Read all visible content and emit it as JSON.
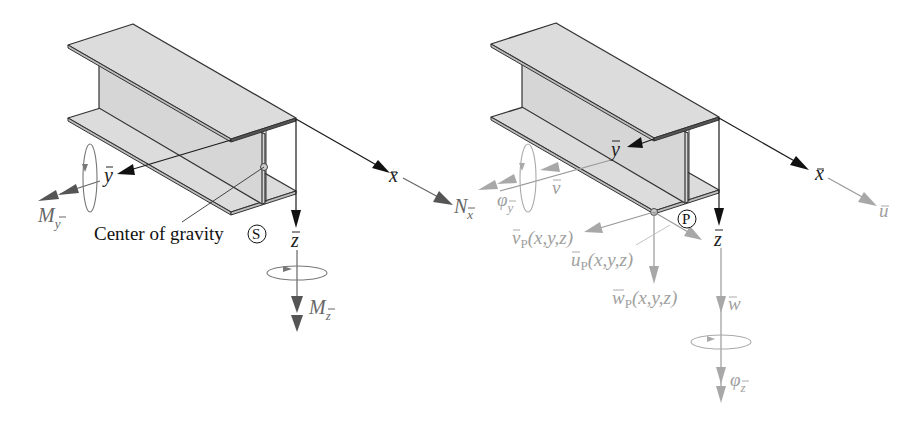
{
  "figure": {
    "left_panel": {
      "name": "Internal forces and moments at center of gravity",
      "axes": {
        "x": "x",
        "y": "y",
        "z": "z"
      },
      "force_labels": {
        "normal_force": {
          "main": "N",
          "sub": "x"
        },
        "moment_y": {
          "main": "M",
          "sub": "y"
        },
        "moment_z": {
          "main": "M",
          "sub": "z"
        }
      },
      "center_of_gravity_caption": "Center of gravity",
      "center_symbol": "S"
    },
    "right_panel": {
      "name": "Displacements and rotations",
      "axes": {
        "x": "x",
        "y": "y",
        "z": "z"
      },
      "displacement_labels": {
        "u": "u",
        "v": "v",
        "w": "w",
        "phi_y": {
          "main": "φ",
          "sub": "y"
        },
        "phi_z": {
          "main": "φ",
          "sub": "z"
        }
      },
      "point_labels": {
        "v_p": {
          "main": "v",
          "sub": "P",
          "args": "(x,y,z)"
        },
        "u_p": {
          "main": "u",
          "sub": "P",
          "args": "(x,y,z)"
        },
        "w_p": {
          "main": "w",
          "sub": "P",
          "args": "(x,y,z)"
        }
      },
      "point_symbol": "P"
    }
  }
}
